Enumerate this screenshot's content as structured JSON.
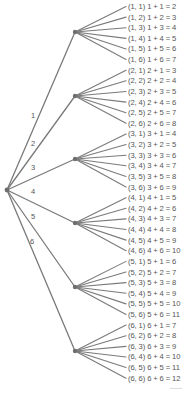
{
  "diagram": {
    "type": "tree",
    "colors": {
      "line": "#7a7a7a",
      "node": "#6e6e6e",
      "text": "#555555"
    },
    "root": {
      "x": 7,
      "y": 190
    },
    "branches": [
      {
        "label": "1",
        "node": {
          "x": 75,
          "y": 32
        },
        "label_pos": {
          "x": 31,
          "y": 111
        },
        "leaves": [
          "(1, 1) 1 + 1 = 2",
          "(1, 2) 1 + 2 = 3",
          "(1, 3) 1 + 3 = 4",
          "(1, 4) 1 + 4 = 5",
          "(1, 5) 1 + 5 = 6",
          "(1, 6) 1 + 6 = 7"
        ]
      },
      {
        "label": "2",
        "node": {
          "x": 75,
          "y": 96
        },
        "label_pos": {
          "x": 31,
          "y": 139
        },
        "leaves": [
          "(2, 1) 2 + 1 = 3",
          "(2, 2) 2 + 2 = 4",
          "(2, 3) 2 + 3 = 5",
          "(2, 4) 2 + 4 = 6",
          "(2, 5) 2 + 5 = 7",
          "(2, 6) 2 + 6 = 8"
        ]
      },
      {
        "label": "3",
        "node": {
          "x": 75,
          "y": 159
        },
        "label_pos": {
          "x": 31,
          "y": 163
        },
        "leaves": [
          "(3, 1) 3 + 1 = 4",
          "(3, 2) 3 + 2 = 5",
          "(3, 3) 3 + 3 = 6",
          "(3, 4) 3 + 4 = 7",
          "(3, 5) 3 + 5 = 8",
          "(3, 6) 3 + 6 = 9"
        ]
      },
      {
        "label": "4",
        "node": {
          "x": 75,
          "y": 223
        },
        "label_pos": {
          "x": 31,
          "y": 187
        },
        "leaves": [
          "(4, 1) 4 + 1 = 5",
          "(4, 2) 4 + 2 = 6",
          "(4, 3) 4 + 3 = 7",
          "(4, 4) 4 + 4 = 8",
          "(4, 5) 4 + 5 = 9",
          "(4, 6) 4 + 6 = 10"
        ]
      },
      {
        "label": "5",
        "node": {
          "x": 75,
          "y": 287
        },
        "label_pos": {
          "x": 31,
          "y": 212
        },
        "leaves": [
          "(5, 1) 5 + 1 = 6",
          "(5, 2) 5 + 2 = 7",
          "(5, 3) 5 + 3 = 8",
          "(5, 4) 5 + 4 = 9",
          "(5, 5) 5 + 5 = 10",
          "(5, 6) 5 + 6 = 11"
        ]
      },
      {
        "label": "6",
        "node": {
          "x": 75,
          "y": 351
        },
        "label_pos": {
          "x": 30,
          "y": 237
        },
        "leaves": [
          "(6, 1) 6 + 1 = 7",
          "(6, 2) 6 + 2 = 8",
          "(6, 3) 6 + 3 = 9",
          "(6, 4) 6 + 4 = 10",
          "(6, 5) 6 + 5 = 11",
          "(6, 6) 6 + 6 = 12"
        ]
      }
    ],
    "leaf_layout": {
      "x_line_end": 126,
      "x_text": 128,
      "y_start": 6.5,
      "y_step": 10.62
    }
  }
}
